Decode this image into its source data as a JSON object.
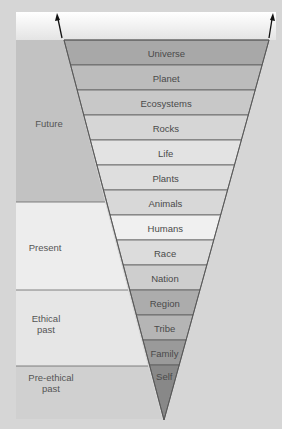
{
  "diagram": {
    "type": "inverted-triangle-hierarchy",
    "bands": [
      {
        "label": "Universe",
        "color": "#a8a8a8"
      },
      {
        "label": "Planet",
        "color": "#bcbcbc"
      },
      {
        "label": "Ecosystems",
        "color": "#c8c8c8"
      },
      {
        "label": "Rocks",
        "color": "#d6d6d6"
      },
      {
        "label": "Life",
        "color": "#e3e3e3"
      },
      {
        "label": "Plants",
        "color": "#dedede"
      },
      {
        "label": "Animals",
        "color": "#d8d8d8"
      },
      {
        "label": "Humans",
        "color": "#f0f0f0"
      },
      {
        "label": "Race",
        "color": "#dcdcdc"
      },
      {
        "label": "Nation",
        "color": "#cecece"
      },
      {
        "label": "Region",
        "color": "#acacac"
      },
      {
        "label": "Tribe",
        "color": "#b5b5b5"
      },
      {
        "label": "Family",
        "color": "#9a9a9a"
      },
      {
        "label": "Self",
        "color": "#888888"
      }
    ],
    "eras": [
      {
        "label": "Future",
        "color": "#c2c2c2"
      },
      {
        "label": "Present",
        "color": "#ededed"
      },
      {
        "label": "Ethical\npast",
        "line1": "Ethical",
        "line2": "past",
        "color": "#e6e6e6"
      },
      {
        "label": "Pre-ethical\npast",
        "line1": "Pre-ethical",
        "line2": "past",
        "color": "#d0d0d0"
      }
    ],
    "arrows": [
      "expansion-arrow-left",
      "expansion-arrow-right"
    ]
  }
}
